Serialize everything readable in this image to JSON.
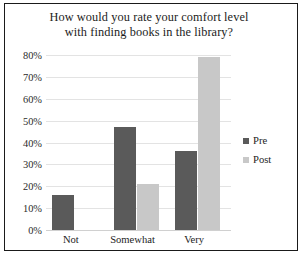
{
  "chart_data": {
    "type": "bar",
    "title": "How would you rate your comfort level with finding books in the library?",
    "title_lines": [
      "How would you rate your comfort level",
      "with finding books in the library?"
    ],
    "categories": [
      "Not",
      "Somewhat",
      "Very"
    ],
    "series": [
      {
        "name": "Pre",
        "values": [
          16,
          47,
          36
        ],
        "color": "#5a5a5a"
      },
      {
        "name": "Post",
        "values": [
          0,
          21,
          79
        ],
        "color": "#c8c8c8"
      }
    ],
    "xlabel": "",
    "ylabel": "",
    "ylim": [
      0,
      80
    ],
    "ytick_values": [
      0,
      10,
      20,
      30,
      40,
      50,
      60,
      70,
      80
    ],
    "ytick_labels": [
      "0%",
      "10%",
      "20%",
      "30%",
      "40%",
      "50%",
      "60%",
      "70%",
      "80%"
    ],
    "grid": true,
    "grid_axis": "y",
    "legend_position": "right",
    "legend_entries": [
      "Pre",
      "Post"
    ],
    "value_format": "percent",
    "background_color": "#ffffff",
    "grid_color": "#e3e3e3",
    "border_color": "#1a1a1a"
  }
}
